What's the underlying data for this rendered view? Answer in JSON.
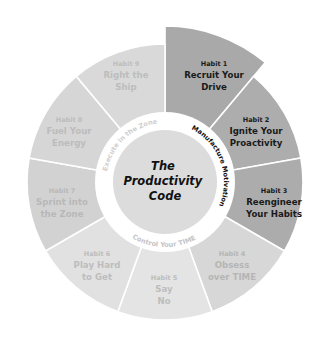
{
  "diagram": {
    "type": "wheel",
    "center_title": [
      "The",
      "Productivity",
      "Code"
    ],
    "ring_labels": [
      {
        "text": "Manufacture Motivation",
        "color": "#111111",
        "start_deg": -62,
        "end_deg": 22
      },
      {
        "text": "Control Your TIME",
        "color": "#c4c4c4",
        "start_deg": 122,
        "end_deg": 60
      },
      {
        "text": "Execute in the Zone",
        "color": "#cfcfcf",
        "start_deg": 188,
        "end_deg": 265
      }
    ],
    "segments": [
      {
        "num": "Habit 1",
        "lines": [
          "Recruit Your",
          "Drive"
        ],
        "fill": "#a9a9a9",
        "text_color": "#1a1a1a",
        "exploded": true,
        "label_x": 214,
        "label_y": 66
      },
      {
        "num": "Habit 2",
        "lines": [
          "Ignite Your",
          "Proactivity"
        ],
        "fill": "#adadad",
        "text_color": "#1a1a1a",
        "exploded": false,
        "label_x": 256,
        "label_y": 122
      },
      {
        "num": "Habit 3",
        "lines": [
          "Reengineer",
          "Your Habits"
        ],
        "fill": "#acacac",
        "text_color": "#1a1a1a",
        "exploded": false,
        "label_x": 274,
        "label_y": 193
      },
      {
        "num": "Habit 4",
        "lines": [
          "Obsess",
          "over TIME"
        ],
        "fill": "#d7d7d7",
        "text_color": "#b5b5b5",
        "exploded": false,
        "label_x": 232,
        "label_y": 256
      },
      {
        "num": "Habit 5",
        "lines": [
          "Say",
          "No"
        ],
        "fill": "#e4e4e4",
        "text_color": "#bdbdbd",
        "exploded": false,
        "label_x": 164,
        "label_y": 280
      },
      {
        "num": "Habit 6",
        "lines": [
          "Play Hard",
          "to Get"
        ],
        "fill": "#e1e1e1",
        "text_color": "#bdbdbd",
        "exploded": false,
        "label_x": 97,
        "label_y": 256
      },
      {
        "num": "Habit 7",
        "lines": [
          "Sprint into",
          "the Zone"
        ],
        "fill": "#d2d2d2",
        "text_color": "#b8b8b8",
        "exploded": false,
        "label_x": 62,
        "label_y": 193
      },
      {
        "num": "Habit 8",
        "lines": [
          "Fuel Your",
          "Energy"
        ],
        "fill": "#d6d6d6",
        "text_color": "#bcbcbc",
        "exploded": false,
        "label_x": 69,
        "label_y": 122
      },
      {
        "num": "Habit 9",
        "lines": [
          "Right the",
          "Ship"
        ],
        "fill": "#d9d9d9",
        "text_color": "#bdbdbd",
        "exploded": false,
        "label_x": 126,
        "label_y": 66
      }
    ],
    "colors": {
      "ring": "#ffffff",
      "center_disc": "#dcdcdc",
      "center_text": "#111111",
      "divider": "#ffffff"
    }
  }
}
